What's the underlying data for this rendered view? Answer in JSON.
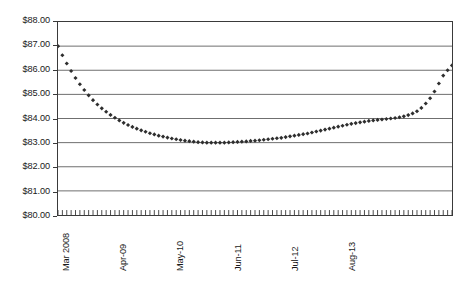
{
  "chart_data": {
    "type": "scatter",
    "title": "",
    "subtitle": "",
    "xlabel": "",
    "ylabel": "",
    "ylim": [
      80,
      88
    ],
    "ytick_step": 1,
    "grid": true,
    "legend": null,
    "marker_style": "diamond",
    "marker_color": "#2e2e2e",
    "y_tick_labels": [
      "$88.00",
      "$87.00",
      "$86.00",
      "$85.00",
      "$84.00",
      "$83.00",
      "$82.00",
      "$81.00",
      "$80.00"
    ],
    "y_tick_values": [
      88,
      87,
      86,
      85,
      84,
      83,
      82,
      81,
      80
    ],
    "x_tick_labels": [
      "Mar 2008",
      "Apr-09",
      "May-10",
      "Jun-11",
      "Jul-12",
      "Aug-13"
    ],
    "x_tick_indices": [
      0,
      13,
      26,
      39,
      52,
      65
    ],
    "x_minor_tick_count": 91,
    "categories": [
      "Mar 2008",
      "Apr-08",
      "May-08",
      "Jun-08",
      "Jul-08",
      "Aug-08",
      "Sep-08",
      "Oct-08",
      "Nov-08",
      "Dec-08",
      "Jan-09",
      "Feb-09",
      "Mar-09",
      "Apr-09",
      "May-09",
      "Jun-09",
      "Jul-09",
      "Aug-09",
      "Sep-09",
      "Oct-09",
      "Nov-09",
      "Dec-09",
      "Jan-10",
      "Feb-10",
      "Mar-10",
      "Apr-10",
      "May-10",
      "Jun-10",
      "Jul-10",
      "Aug-10",
      "Sep-10",
      "Oct-10",
      "Nov-10",
      "Dec-10",
      "Jan-11",
      "Feb-11",
      "Mar-11",
      "Apr-11",
      "May-11",
      "Jun-11",
      "Jul-11",
      "Aug-11",
      "Sep-11",
      "Oct-11",
      "Nov-11",
      "Dec-11",
      "Jan-12",
      "Feb-12",
      "Mar-12",
      "Apr-12",
      "May-12",
      "Jun-12",
      "Jul-12",
      "Aug-12",
      "Sep-12",
      "Oct-12",
      "Nov-12",
      "Dec-12",
      "Jan-13",
      "Feb-13",
      "Mar-13",
      "Apr-13",
      "May-13",
      "Jun-13",
      "Jul-13",
      "Aug-13",
      "Sep-13",
      "Oct-13",
      "Nov-13",
      "Dec-13",
      "Jan-14",
      "Feb-14",
      "Mar-14",
      "Apr-14",
      "May-14",
      "Jun-14",
      "Jul-14",
      "Aug-14",
      "Sep-14",
      "Oct-14",
      "Nov-14",
      "Dec-14",
      "Jan-15",
      "Feb-15",
      "Mar-15",
      "Apr-15",
      "May-15",
      "Jun-15",
      "Jul-15",
      "Aug-15",
      "Sep-15"
    ],
    "values": [
      87.0,
      86.62,
      86.28,
      85.97,
      85.68,
      85.42,
      85.18,
      84.96,
      84.76,
      84.58,
      84.42,
      84.28,
      84.15,
      84.03,
      83.92,
      83.82,
      83.73,
      83.65,
      83.58,
      83.51,
      83.45,
      83.39,
      83.34,
      83.29,
      83.25,
      83.21,
      83.17,
      83.14,
      83.11,
      83.08,
      83.06,
      83.04,
      83.02,
      83.01,
      83.0,
      83.0,
      83.0,
      83.0,
      83.0,
      83.01,
      83.02,
      83.03,
      83.04,
      83.05,
      83.07,
      83.08,
      83.1,
      83.12,
      83.14,
      83.16,
      83.18,
      83.2,
      83.23,
      83.26,
      83.29,
      83.32,
      83.35,
      83.38,
      83.42,
      83.46,
      83.5,
      83.54,
      83.58,
      83.62,
      83.66,
      83.7,
      83.74,
      83.78,
      83.81,
      83.84,
      83.87,
      83.9,
      83.92,
      83.94,
      83.96,
      83.98,
      84.0,
      84.02,
      84.05,
      84.09,
      84.14,
      84.21,
      84.3,
      84.44,
      84.62,
      84.84,
      85.12,
      85.45,
      85.78,
      86.0,
      86.2
    ]
  }
}
